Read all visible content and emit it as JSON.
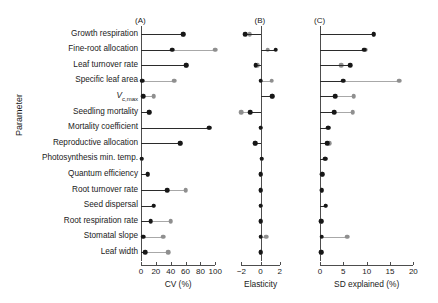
{
  "chart_data": {
    "type": "scatter",
    "title": "",
    "ylabel": "Parameter",
    "grid": false,
    "legend": "none",
    "marker_colors": {
      "dark": "#171717",
      "light": "#8f8f8f"
    },
    "categories": [
      "Growth respiration",
      "Fine-root allocation",
      "Leaf turnover rate",
      "Specific leaf area",
      "Vc,max",
      "Seedling mortality",
      "Mortality coefficient",
      "Reproductive allocation",
      "Photosynthesis min. temp.",
      "Quantum efficiency",
      "Root turnover rate",
      "Seed dispersal",
      "Root respiration rate",
      "Stomatal slope",
      "Leaf width"
    ],
    "panels": [
      {
        "id": "A",
        "label": "(A)",
        "xlabel": "CV (%)",
        "xlim": [
          0,
          105
        ],
        "baseline": 0,
        "ticks": [
          0,
          20,
          40,
          60,
          80,
          100
        ],
        "ticklabels": [
          "0",
          "20",
          "40",
          "60",
          "80",
          "100"
        ],
        "series": [
          {
            "name": "dark",
            "values": [
              57,
              42,
              61,
              2,
              3,
              11,
              92,
              53,
              1,
              9,
              35,
              17,
              13,
              3,
              6
            ]
          },
          {
            "name": "light",
            "values": [
              57,
              100,
              61,
              45,
              17,
              11,
              92,
              53,
              1,
              9,
              60,
              17,
              40,
              30,
              37
            ]
          }
        ]
      },
      {
        "id": "B",
        "label": "(B)",
        "xlabel": "Elasticity",
        "xlim": [
          -3.1,
          3.4
        ],
        "baseline": 0,
        "ticks": [
          -2,
          0,
          2
        ],
        "ticklabels": [
          "−2",
          "0",
          "2"
        ],
        "series": [
          {
            "name": "dark",
            "values": [
              -1.6,
              1.6,
              -0.5,
              0.0,
              1.2,
              -1.1,
              0.0,
              -0.55,
              0.1,
              0.0,
              0.0,
              0.0,
              0.0,
              0.0,
              0.0
            ]
          },
          {
            "name": "light",
            "values": [
              -1.15,
              0.75,
              -0.28,
              1.15,
              1.2,
              -2.0,
              0.0,
              -0.55,
              0.1,
              0.0,
              0.0,
              0.0,
              0.0,
              0.62,
              0.0
            ]
          }
        ]
      },
      {
        "id": "C",
        "label": "(C)",
        "xlabel": "SD explained (%)",
        "xlim": [
          0,
          21
        ],
        "baseline": 0,
        "ticks": [
          0,
          5,
          10,
          15,
          20
        ],
        "ticklabels": [
          "0",
          "5",
          "10",
          "15",
          "20"
        ],
        "series": [
          {
            "name": "dark",
            "values": [
              11.5,
              9.5,
              6.5,
              5.0,
              3.3,
              3.0,
              1.8,
              1.5,
              1.1,
              0.5,
              0.4,
              1.2,
              0.2,
              0.4,
              0.3
            ]
          },
          {
            "name": "light",
            "values": [
              11.5,
              9.8,
              4.6,
              17.0,
              7.2,
              7.0,
              1.8,
              2.0,
              1.1,
              0.5,
              0.4,
              1.2,
              0.2,
              5.8,
              0.3
            ]
          }
        ]
      }
    ]
  }
}
